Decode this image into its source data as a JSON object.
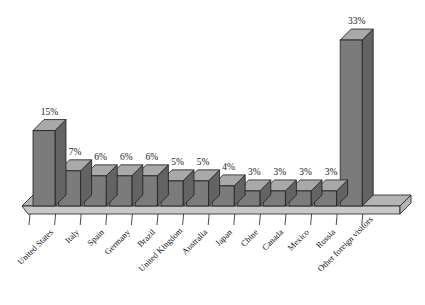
{
  "chart_data": {
    "type": "bar",
    "title": "",
    "subtitle": "",
    "xlabel": "",
    "ylabel": "",
    "grid": false,
    "legend": false,
    "legend_position": "none",
    "ylim": [
      0,
      35
    ],
    "value_suffix": "%",
    "categories": [
      "United States",
      "Italy",
      "Spain",
      "Germany",
      "Brazil",
      "United Kingdom",
      "Australia",
      "Japan",
      "Chine",
      "Canada",
      "Mexico",
      "Russia",
      "Other foreign visitors"
    ],
    "values": [
      15,
      7,
      6,
      6,
      6,
      5,
      5,
      4,
      3,
      3,
      3,
      3,
      33
    ],
    "data_labels": [
      "15%",
      "7%",
      "6%",
      "6%",
      "6%",
      "5%",
      "5%",
      "4%",
      "3%",
      "3%",
      "3%",
      "3%",
      "33%"
    ]
  },
  "style": {
    "bar_front": "#7b7b7b",
    "bar_top": "#a9a9a9",
    "bar_side": "#636363",
    "floor_top": "#b4b4b4",
    "floor_front": "#c9c9c9",
    "outline": "#1c1c1c",
    "text": "#111111",
    "background": "#ffffff"
  }
}
